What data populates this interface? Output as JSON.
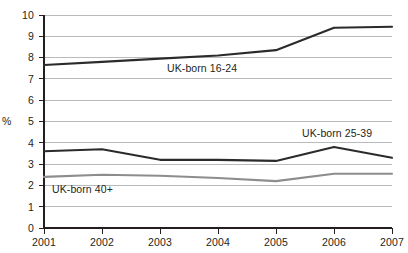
{
  "chart_data": {
    "type": "line",
    "title": "",
    "subtitle": "",
    "xlabel": "",
    "ylabel": "%",
    "categories": [
      "2001",
      "2002",
      "2003",
      "2004",
      "2005",
      "2006",
      "2007"
    ],
    "x": [
      2001,
      2002,
      2003,
      2004,
      2005,
      2006,
      2007
    ],
    "ylim": [
      0,
      10
    ],
    "xlim": [
      2001,
      2007
    ],
    "y_ticks": [
      "0",
      "1",
      "2",
      "3",
      "4",
      "5",
      "6",
      "7",
      "8",
      "9",
      "10"
    ],
    "y_tick_values": [
      0,
      1,
      2,
      3,
      4,
      5,
      6,
      7,
      8,
      9,
      10
    ],
    "grid": true,
    "grid_axis": "y",
    "legend_position": "inline-annotations",
    "series": [
      {
        "name": "UK-born 16-24",
        "color": "#2b2b2b",
        "values": [
          7.65,
          7.8,
          7.95,
          8.1,
          8.35,
          9.4,
          9.45
        ]
      },
      {
        "name": "UK-born 25-39",
        "color": "#2b2b2b",
        "values": [
          3.6,
          3.7,
          3.2,
          3.2,
          3.15,
          3.8,
          3.3
        ]
      },
      {
        "name": "UK-born 40+",
        "color": "#8d8d8d",
        "values": [
          2.4,
          2.5,
          2.45,
          2.35,
          2.2,
          2.55,
          2.55
        ]
      }
    ],
    "annotations": [
      {
        "text": "UK-born 16-24",
        "x": 2003.2,
        "y": 7.35
      },
      {
        "text": "UK-born 25-39",
        "x": 2005.3,
        "y": 4.42
      },
      {
        "text": "UK-born 40+",
        "x": 2001.15,
        "y": 1.95
      }
    ]
  },
  "axis": {
    "y_title": "%"
  },
  "caption": {
    "text": ""
  }
}
